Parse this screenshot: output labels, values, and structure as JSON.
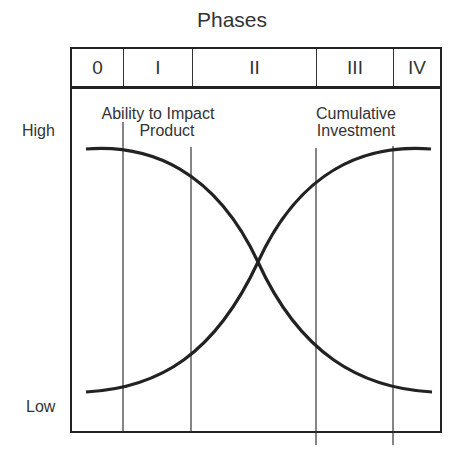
{
  "title": "Phases",
  "phases": [
    {
      "label": "0",
      "width": 52
    },
    {
      "label": "I",
      "width": 69
    },
    {
      "label": "II",
      "width": 124
    },
    {
      "label": "III",
      "width": 77
    },
    {
      "label": "IV",
      "width": 50
    }
  ],
  "y_axis": {
    "high_label": "High",
    "low_label": "Low"
  },
  "curves": [
    {
      "name": "ability-to-impact-product",
      "label_line1": "Ability to Impact",
      "label_line2": "Product",
      "trend": "decreasing"
    },
    {
      "name": "cumulative-investment",
      "label_line1": "Cumulative",
      "label_line2": "Investment",
      "trend": "increasing"
    }
  ],
  "colors": {
    "line": "#222222",
    "text": "#333333",
    "background": "#ffffff"
  }
}
